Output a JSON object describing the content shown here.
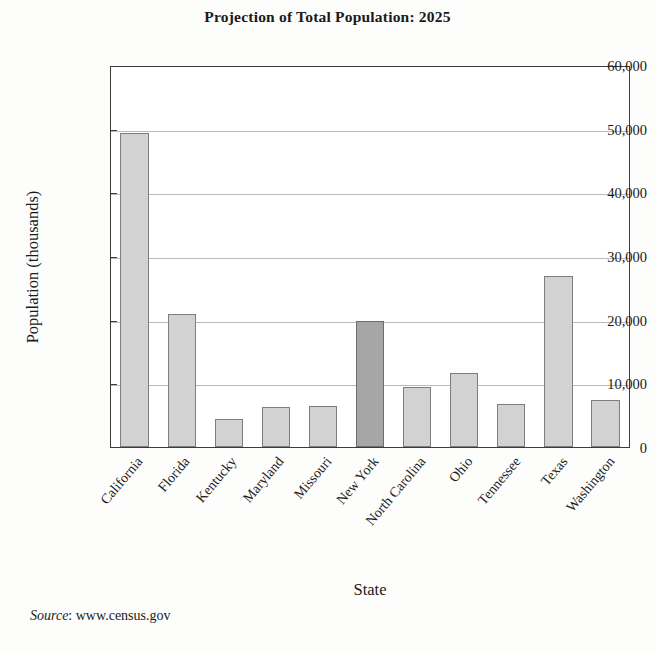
{
  "chart_data": {
    "type": "bar",
    "title": "Projection of Total Population: 2025",
    "xlabel": "State",
    "ylabel": "Population (thousands)",
    "ylim": [
      0,
      60000
    ],
    "ytick_values": [
      0,
      10000,
      20000,
      30000,
      40000,
      50000,
      60000
    ],
    "ytick_labels": [
      "0",
      "10,000",
      "20,000",
      "30,000",
      "40,000",
      "50,000",
      "60,000"
    ],
    "grid": "horizontal",
    "legend": "none",
    "categories": [
      "California",
      "Florida",
      "Kentucky",
      "Maryland",
      "Missouri",
      "New York",
      "North Carolina",
      "Ohio",
      "Tennessee",
      "Texas",
      "Washington"
    ],
    "values": [
      49300,
      20900,
      4400,
      6300,
      6400,
      19800,
      9350,
      11600,
      6700,
      26850,
      7350
    ],
    "bar_colors": [
      "#d2d2d2",
      "#d2d2d2",
      "#d2d2d2",
      "#d2d2d2",
      "#d2d2d2",
      "#a6a6a6",
      "#d2d2d2",
      "#d2d2d2",
      "#d2d2d2",
      "#d2d2d2",
      "#d2d2d2"
    ],
    "highlighted_category": "New York",
    "annotations": {
      "source_word": "Source",
      "source_separator": ": ",
      "source_value": "www.census.gov"
    }
  },
  "colors": {
    "bar_fill": "#d2d2d2",
    "bar_fill_highlight": "#a6a6a6",
    "bar_stroke": "#7d7d7d",
    "axis": "#3b3b3b",
    "gridline": "#b9b9b9",
    "background": "#fdfdfc",
    "text": "#1a1a1a"
  }
}
